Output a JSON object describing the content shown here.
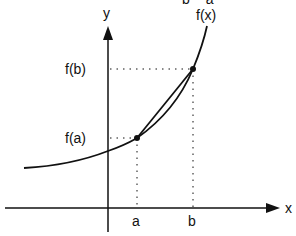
{
  "diagram": {
    "top_cut_text": "b − a",
    "axis_x_label": "x",
    "axis_y_label": "y",
    "curve_label": "f(x)",
    "point_a_label": "a",
    "point_b_label": "b",
    "value_a_label": "f(a)",
    "value_b_label": "f(b)",
    "colors": {
      "ink": "#111111",
      "background": "#ffffff"
    }
  }
}
